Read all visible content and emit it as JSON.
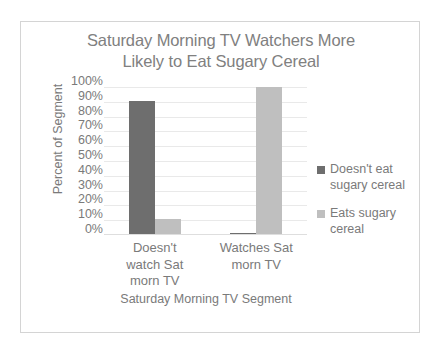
{
  "chart_data": {
    "type": "bar",
    "title": "Saturday Morning TV Watchers More Likely to Eat Sugary Cereal",
    "title_line1": "Saturday Morning TV Watchers More",
    "title_line2": "Likely to Eat Sugary Cereal",
    "xlabel": "Saturday Morning TV Segment",
    "ylabel": "Percent of Segment",
    "categories": [
      "Doesn't watch Sat morn TV",
      "Watches Sat morn TV"
    ],
    "category_lines": [
      [
        "Doesn't",
        "watch Sat",
        "morn TV"
      ],
      [
        "Watches Sat",
        "morn TV"
      ]
    ],
    "series": [
      {
        "name": "Doesn't eat sugary cereal",
        "name_lines": [
          "Doesn't eat",
          "sugary cereal"
        ],
        "color": "#6e6e6e",
        "values": [
          90,
          1
        ]
      },
      {
        "name": "Eats sugary cereal",
        "name_lines": [
          "Eats sugary",
          "cereal"
        ],
        "color": "#bfbfbf",
        "values": [
          10,
          99
        ]
      }
    ],
    "ylim": [
      0,
      100
    ],
    "ytick_values": [
      100,
      90,
      80,
      70,
      60,
      50,
      40,
      30,
      20,
      10,
      0
    ],
    "ytick_labels": [
      "100%",
      "90%",
      "80%",
      "70%",
      "60%",
      "50%",
      "40%",
      "30%",
      "20%",
      "10%",
      "0%"
    ],
    "grid": true,
    "legend_position": "right",
    "colors": {
      "text": "#7a7a7a",
      "title": "#808080",
      "gridline": "#e9e9e9",
      "border": "#d4d4d4",
      "background": "#ffffff"
    }
  }
}
